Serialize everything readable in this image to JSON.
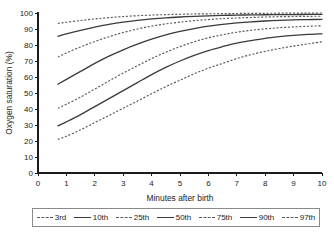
{
  "chart_data": {
    "type": "line",
    "title": "",
    "xlabel": "Minutes after birth",
    "ylabel": "Oxygen saturation (%)",
    "xlim": [
      0,
      10
    ],
    "ylim": [
      0,
      100
    ],
    "xticks": [
      "0",
      "1",
      "2",
      "3",
      "4",
      "5",
      "6",
      "7",
      "8",
      "9",
      "10"
    ],
    "yticks": [
      "0",
      "10",
      "20",
      "30",
      "40",
      "50",
      "60",
      "70",
      "80",
      "90",
      "100"
    ],
    "grid": false,
    "legend_position": "bottom",
    "x": [
      0.7,
      1,
      1.5,
      2,
      2.5,
      3,
      3.5,
      4,
      4.5,
      5,
      5.5,
      6,
      6.5,
      7,
      7.5,
      8,
      8.5,
      9,
      9.5,
      10
    ],
    "series": [
      {
        "name": "3rd",
        "style": "dashed",
        "values": [
          21,
          23,
          27,
          31.5,
          36,
          40.5,
          45,
          49.5,
          54,
          58,
          62,
          65.5,
          68.5,
          71.5,
          74,
          76,
          77.8,
          79.3,
          80.7,
          82
        ]
      },
      {
        "name": "10th",
        "style": "solid",
        "values": [
          29.5,
          32,
          36.5,
          41.5,
          46.5,
          51.5,
          56.5,
          61.5,
          66,
          70,
          73.5,
          76.5,
          79,
          81.2,
          82.8,
          84.2,
          85.2,
          86,
          86.6,
          87
        ]
      },
      {
        "name": "25th",
        "style": "dashed",
        "values": [
          40.5,
          43,
          47.5,
          52.5,
          57.5,
          62.5,
          67,
          71.5,
          75.5,
          79,
          82,
          84.5,
          86.4,
          88,
          89.2,
          90.1,
          90.8,
          91.3,
          91.7,
          92
        ]
      },
      {
        "name": "50th",
        "style": "solid",
        "values": [
          55.5,
          58.5,
          63.5,
          68.5,
          73,
          77,
          80.5,
          83.6,
          86.3,
          88.5,
          90.3,
          91.8,
          92.9,
          93.8,
          94.5,
          95,
          95.4,
          95.7,
          95.9,
          96
        ]
      },
      {
        "name": "75th",
        "style": "dashed",
        "values": [
          72.5,
          75,
          78.8,
          82.2,
          85.2,
          87.8,
          90,
          91.8,
          93.2,
          94.3,
          95.2,
          95.9,
          96.5,
          96.9,
          97.2,
          97.5,
          97.7,
          97.8,
          97.9,
          98
        ]
      },
      {
        "name": "90th",
        "style": "solid",
        "values": [
          85.5,
          87,
          89.2,
          91.2,
          92.9,
          94.3,
          95.4,
          96.3,
          97,
          97.5,
          97.9,
          98.2,
          98.5,
          98.7,
          98.8,
          98.9,
          99,
          99,
          99.1,
          99.1
        ]
      },
      {
        "name": "97th",
        "style": "dashed",
        "values": [
          93.5,
          94.2,
          95.3,
          96.3,
          97.1,
          97.8,
          98.3,
          98.7,
          99,
          99.2,
          99.4,
          99.5,
          99.6,
          99.7,
          99.8,
          99.8,
          99.9,
          99.9,
          99.9,
          100
        ]
      }
    ]
  },
  "legend": {
    "entries": [
      {
        "label": "3rd"
      },
      {
        "label": "10th"
      },
      {
        "label": "25th"
      },
      {
        "label": "50th"
      },
      {
        "label": "75th"
      },
      {
        "label": "90th"
      },
      {
        "label": "97th"
      }
    ]
  }
}
